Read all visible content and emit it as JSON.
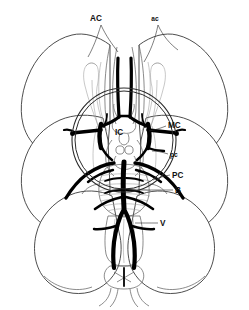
{
  "figure": {
    "view": "inferior (ventral) surface of cerebrum, brainstem and cerebellum",
    "background_color": "#ffffff",
    "outline_color": "#3a3a3a",
    "artery_color": "#000000",
    "label_color": "#111111"
  },
  "labels": {
    "anterior_cerebral": {
      "text": "AC",
      "meaning": "anterior cerebral artery",
      "x": 96,
      "y": 21,
      "size": "lg"
    },
    "anterior_communicating": {
      "text": "ac",
      "meaning": "anterior communicating artery",
      "x": 155,
      "y": 21,
      "size": "sm"
    },
    "internal_carotid": {
      "text": "IC",
      "meaning": "internal carotid artery",
      "x": 119,
      "y": 135,
      "size": "lg"
    },
    "middle_cerebral": {
      "text": "MC",
      "meaning": "middle cerebral artery",
      "x": 168,
      "y": 128,
      "size": "lg"
    },
    "posterior_communicating": {
      "text": "pc",
      "meaning": "posterior communicating artery",
      "x": 170,
      "y": 156,
      "size": "sm"
    },
    "posterior_cerebral": {
      "text": "PC",
      "meaning": "posterior cerebral artery",
      "x": 172,
      "y": 177,
      "size": "lg"
    },
    "basilar": {
      "text": "B",
      "meaning": "basilar artery",
      "x": 175,
      "y": 192,
      "size": "lg"
    },
    "vertebral": {
      "text": "V",
      "meaning": "vertebral artery",
      "x": 160,
      "y": 225,
      "size": "lg"
    }
  },
  "structures": [
    {
      "name": "frontal-lobe-left"
    },
    {
      "name": "frontal-lobe-right"
    },
    {
      "name": "temporal-lobe-left"
    },
    {
      "name": "temporal-lobe-right"
    },
    {
      "name": "cerebellum-left"
    },
    {
      "name": "cerebellum-right"
    },
    {
      "name": "olfactory-tract-left"
    },
    {
      "name": "olfactory-tract-right"
    },
    {
      "name": "optic-chiasm"
    },
    {
      "name": "mammillary-bodies"
    },
    {
      "name": "pons"
    },
    {
      "name": "medulla-oblongata"
    },
    {
      "name": "pyramidal-decussation"
    },
    {
      "name": "spinal-cord"
    },
    {
      "name": "magnifier-circle"
    }
  ]
}
